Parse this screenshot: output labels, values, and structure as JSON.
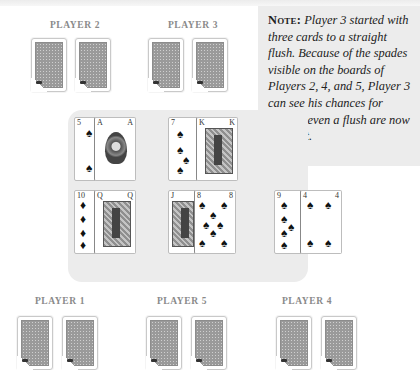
{
  "note": {
    "label": "Note:",
    "text": " Player 3 started with three cards to a straight flush. Because of the spades visible on the boards of Players 2, 4, and 5, Player 3 can see his chances for making even a flush are now in doubt."
  },
  "players": {
    "p2": {
      "label": "PLAYER 2"
    },
    "p3": {
      "label": "PLAYER 3"
    },
    "p1": {
      "label": "PLAYER 1"
    },
    "p5": {
      "label": "PLAYER 5"
    },
    "p4": {
      "label": "PLAYER 4"
    }
  },
  "board": {
    "row1": [
      {
        "rank": "5",
        "suit": "♠",
        "label": "5 of spades"
      },
      {
        "rank": "A",
        "suit": "♠",
        "label": "Ace of spades"
      },
      {
        "rank": "7",
        "suit": "♠",
        "label": "7 of spades"
      },
      {
        "rank": "K",
        "suit": "♠",
        "label": "King of spades"
      }
    ],
    "row2": [
      {
        "rank": "10",
        "suit": "♦",
        "label": "10 of diamonds"
      },
      {
        "rank": "Q",
        "suit": "♠",
        "label": "Queen of spades"
      },
      {
        "rank": "J",
        "suit": "♦",
        "label": "Jack of diamonds"
      },
      {
        "rank": "8",
        "suit": "♠",
        "label": "8 of spades"
      },
      {
        "rank": "9",
        "suit": "♠",
        "label": "9 of spades"
      },
      {
        "rank": "4",
        "suit": "♠",
        "label": "4 of spades"
      }
    ]
  }
}
